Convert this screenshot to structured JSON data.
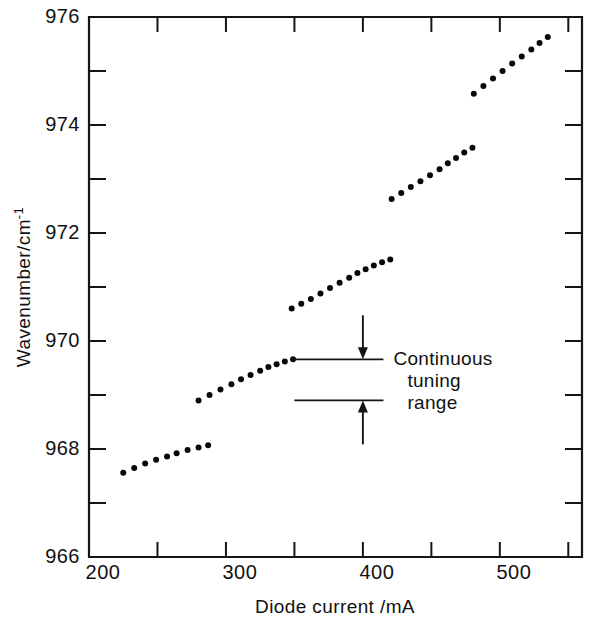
{
  "chart_data": {
    "type": "scatter",
    "title": "",
    "xlabel": "Diode current /mA",
    "ylabel": "Wavenumber/cm",
    "ylabel_exponent": "-1",
    "ylabel_full": "Wavenumber/cm⁻¹",
    "xlim": [
      200,
      560
    ],
    "ylim": [
      966,
      976
    ],
    "xticks_major": [
      200,
      300,
      400,
      500
    ],
    "xticks_minor": [
      250,
      350,
      450,
      550
    ],
    "xticklabels": [
      "200",
      "300",
      "400",
      "500"
    ],
    "yticks_major": [
      966,
      968,
      970,
      972,
      974,
      976
    ],
    "yticks_minor": [
      967,
      969,
      971,
      973,
      975
    ],
    "yticklabels": [
      "966",
      "968",
      "970",
      "972",
      "974",
      "976"
    ],
    "grid": false,
    "legend": null,
    "marker": "dot",
    "series": [
      {
        "name": "mode 1",
        "x": [
          225,
          233,
          241,
          249,
          257,
          264,
          272,
          280,
          287
        ],
        "y": [
          967.56,
          967.65,
          967.73,
          967.8,
          967.86,
          967.92,
          967.98,
          968.03,
          968.07
        ]
      },
      {
        "name": "mode 2",
        "x": [
          280,
          288,
          296,
          304,
          311,
          318,
          325,
          331,
          337,
          343,
          349
        ],
        "y": [
          968.9,
          969.0,
          969.1,
          969.2,
          969.29,
          969.37,
          969.45,
          969.52,
          969.57,
          969.62,
          969.66
        ]
      },
      {
        "name": "mode 3",
        "x": [
          348,
          355,
          362,
          369,
          376,
          383,
          390,
          396,
          402,
          408,
          414,
          420
        ],
        "y": [
          970.6,
          970.69,
          970.78,
          970.88,
          970.98,
          971.08,
          971.17,
          971.26,
          971.33,
          971.4,
          971.46,
          971.51
        ]
      },
      {
        "name": "mode 4",
        "x": [
          421,
          428,
          435,
          442,
          449,
          456,
          462,
          468,
          474,
          480
        ],
        "y": [
          972.63,
          972.74,
          972.85,
          972.96,
          973.07,
          973.18,
          973.29,
          973.39,
          973.49,
          973.58
        ]
      },
      {
        "name": "mode 5",
        "x": [
          481,
          488,
          495,
          502,
          509,
          516,
          523,
          529,
          535
        ],
        "y": [
          974.58,
          974.72,
          974.86,
          975.0,
          975.14,
          975.27,
          975.4,
          975.52,
          975.63
        ]
      }
    ],
    "annotations": [
      {
        "id": "continuous-tuning-range",
        "lines": [
          "Continuous",
          "tuning",
          "range"
        ],
        "text": "Continuous tuning range",
        "upper_value": 969.66,
        "lower_value": 968.9,
        "marker_x": 400,
        "bracket_x_start": 350,
        "bracket_x_end": 415
      }
    ],
    "colors": {
      "axis": "#151515",
      "point": "#080808",
      "background": "#ffffff",
      "annotation": "#151515"
    }
  }
}
